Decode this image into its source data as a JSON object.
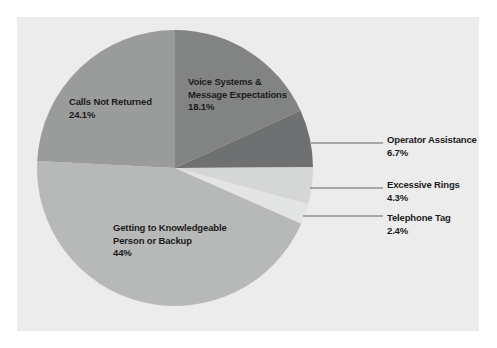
{
  "chart_data": {
    "type": "pie",
    "title": "",
    "subtitle": "",
    "xlabel": "",
    "ylabel": "",
    "legend_position": "none",
    "grid": false,
    "units": "percent",
    "total": 99.6,
    "categories": [
      "Voice Systems & Message Expectations",
      "Operator Assistance",
      "Excessive Rings",
      "Telephone Tag",
      "Getting to Knowledgeable Person or Backup",
      "Calls Not Returned"
    ],
    "values": [
      18.1,
      6.7,
      4.3,
      2.4,
      44,
      24.1
    ],
    "slices": [
      {
        "name": "voice-systems",
        "label_line1": "Voice Systems &",
        "label_line2": "Message Expectations",
        "value": 18.1,
        "value_text": "18.1%",
        "color": "#828383",
        "label_placement": "inside"
      },
      {
        "name": "operator-assistance",
        "label_line1": "Operator Assistance",
        "label_line2": "",
        "value": 6.7,
        "value_text": "6.7%",
        "color": "#6f7071",
        "label_placement": "callout"
      },
      {
        "name": "excessive-rings",
        "label_line1": "Excessive Rings",
        "label_line2": "",
        "value": 4.3,
        "value_text": "4.3%",
        "color": "#d5d6d6",
        "label_placement": "callout"
      },
      {
        "name": "telephone-tag",
        "label_line1": "Telephone Tag",
        "label_line2": "",
        "value": 2.4,
        "value_text": "2.4%",
        "color": "#e3e4e4",
        "label_placement": "callout"
      },
      {
        "name": "getting-to-knowledgeable-person",
        "label_line1": "Getting to Knowledgeable",
        "label_line2": "Person or Backup",
        "value": 44,
        "value_text": "44%",
        "color": "#b7b8b8",
        "label_placement": "inside"
      },
      {
        "name": "calls-not-returned",
        "label_line1": "Calls Not Returned",
        "label_line2": "",
        "value": 24.1,
        "value_text": "24.1%",
        "color": "#9a9b9b",
        "label_placement": "inside"
      }
    ],
    "colors": {
      "panel_background": "#ececed",
      "page_background": "#ffffff",
      "leader_line": "#55565a",
      "text": "#1c1c1c"
    }
  }
}
